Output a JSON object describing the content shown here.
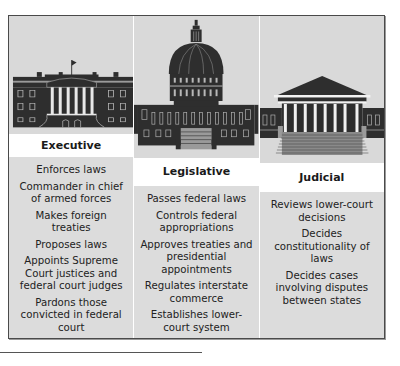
{
  "branches": [
    {
      "name": "Executive",
      "building_icon": "white-house-icon",
      "powers": [
        "Enforces laws",
        "Commander in chief of armed forces",
        "Makes foreign treaties",
        "Proposes laws",
        "Appoints Supreme Court justices and federal court judges",
        "Pardons those convicted in federal court"
      ]
    },
    {
      "name": "Legislative",
      "building_icon": "capitol-building-icon",
      "powers": [
        "Passes federal laws",
        "Controls federal appropriations",
        "Approves treaties and presidential appointments",
        "Regulates interstate commerce",
        "Establishes lower-court system"
      ]
    },
    {
      "name": "Judicial",
      "building_icon": "supreme-court-icon",
      "powers": [
        "Reviews lower-court decisions",
        "Decides constitutionality of laws",
        "Decides cases involving disputes between states"
      ]
    }
  ],
  "colors": {
    "panel_bg": "#dcdcdc",
    "header_bg": "#ffffff",
    "building_dark": "#2e2e2e",
    "border": "#4a4a4a"
  }
}
